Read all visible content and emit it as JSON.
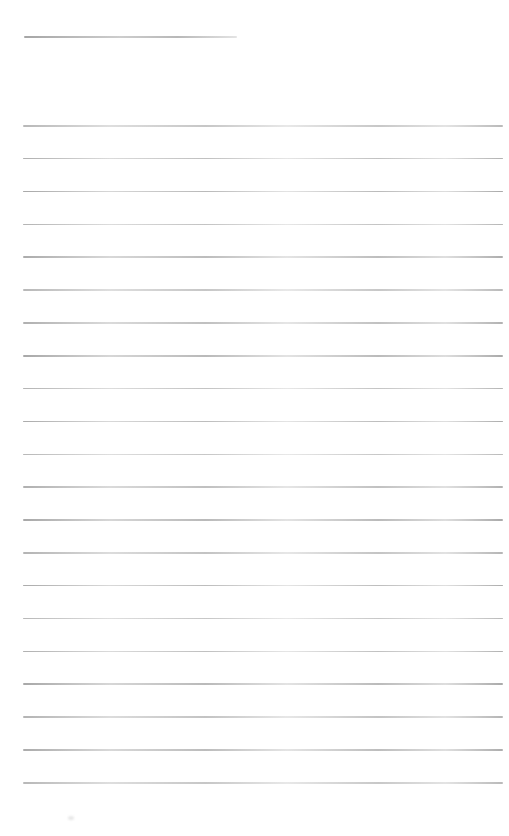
{
  "page": {
    "kind": "blank-lined-note-page",
    "width": 509,
    "height": 836,
    "background": "#ffffff",
    "text_content": ""
  },
  "colors": {
    "rule_line": "#b3b3b3",
    "title_underline": "#ababab"
  },
  "title_line": {
    "x": 24,
    "y": 36,
    "width": 213
  },
  "ruled_lines": {
    "count": 21,
    "x": 23,
    "width": 480,
    "start_y": 125,
    "spacing": 32.85
  },
  "artifact": {
    "x": 68,
    "y": 816
  }
}
